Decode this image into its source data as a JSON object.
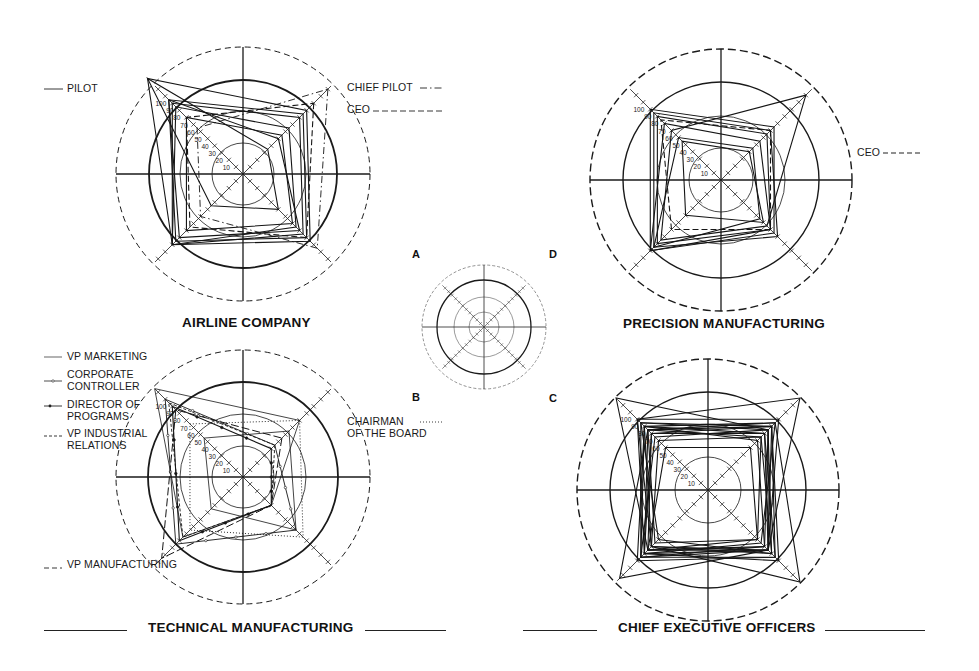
{
  "figure": {
    "key_letters": [
      "A",
      "B",
      "C",
      "D"
    ]
  },
  "charts": [
    {
      "id": "airline",
      "title": "AIRLINE COMPANY",
      "legend": [
        {
          "label": "PILOT",
          "style": "solid"
        },
        {
          "label": "CHIEF PILOT",
          "style": "dash-dot"
        },
        {
          "label": "CEO",
          "style": "dashed"
        }
      ]
    },
    {
      "id": "precision",
      "title": "PRECISION MANUFACTURING",
      "legend": [
        {
          "label": "CEO",
          "style": "dashed"
        }
      ]
    },
    {
      "id": "technical",
      "title": "TECHNICAL MANUFACTURING",
      "legend": [
        {
          "label": "VP MARKETING",
          "style": "solid-thin"
        },
        {
          "label_lines": [
            "CORPORATE",
            "CONTROLLER"
          ],
          "style": "solid-open-marker"
        },
        {
          "label_lines": [
            "DIRECTOR OF",
            "PROGRAMS"
          ],
          "style": "solid-filled-marker"
        },
        {
          "label_lines": [
            "VP INDUSTRIAL",
            "RELATIONS"
          ],
          "style": "short-dash"
        },
        {
          "label_lines": [
            "CHAIRMAN",
            "OF THE BOARD"
          ],
          "style": "dotted"
        },
        {
          "label": "VP MANUFACTURING",
          "style": "long-dash"
        }
      ]
    },
    {
      "id": "ceo",
      "title": "CHIEF EXECUTIVE OFFICERS",
      "legend": []
    }
  ],
  "chart_data": [
    {
      "type": "radar",
      "title": "AIRLINE COMPANY",
      "axes": [
        "NE (A-D diagonal)",
        "SE",
        "SW",
        "NW"
      ],
      "scale_ticks": [
        10,
        20,
        30,
        40,
        50,
        60,
        70,
        80,
        90,
        100
      ],
      "rings": [
        "inner",
        "middle",
        "bold",
        "outer-dashed"
      ],
      "grid": true,
      "center": [
        243,
        174
      ],
      "radii": {
        "inner": 31,
        "middle": 63,
        "bold": 94,
        "outer": 127
      },
      "unit_px": 1.0,
      "series": [
        {
          "name": "PILOT",
          "style": "solid",
          "values": [
            90,
            95,
            100,
            135
          ]
        },
        {
          "name": "PILOT",
          "style": "solid",
          "values": [
            85,
            90,
            95,
            105
          ]
        },
        {
          "name": "PILOT",
          "style": "solid",
          "values": [
            80,
            85,
            100,
            100
          ]
        },
        {
          "name": "PILOT",
          "style": "solid",
          "values": [
            65,
            75,
            100,
            95
          ]
        },
        {
          "name": "PILOT",
          "style": "solid",
          "values": [
            50,
            80,
            90,
            105
          ]
        },
        {
          "name": "PILOT",
          "style": "solid",
          "values": [
            35,
            50,
            45,
            135
          ]
        },
        {
          "name": "PILOT",
          "style": "solid",
          "values": [
            55,
            70,
            80,
            80
          ]
        },
        {
          "name": "CHIEF PILOT",
          "style": "dash-dot",
          "values": [
            120,
            105,
            60,
            65
          ]
        },
        {
          "name": "CEO",
          "style": "dashed",
          "values": [
            100,
            90,
            75,
            80
          ]
        }
      ]
    },
    {
      "type": "radar",
      "title": "PRECISION MANUFACTURING",
      "axes": [
        "NE",
        "SE",
        "SW",
        "NW"
      ],
      "scale_ticks": [
        10,
        20,
        30,
        40,
        50,
        60,
        70,
        80,
        90,
        100
      ],
      "grid": true,
      "center": [
        721,
        180
      ],
      "radii": {
        "inner": 32,
        "middle": 64,
        "bold": 98,
        "outer": 131
      },
      "unit_px": 1.0,
      "series": [
        {
          "name": "manager",
          "style": "solid",
          "values": [
            75,
            75,
            100,
            100
          ]
        },
        {
          "name": "manager",
          "style": "solid",
          "values": [
            70,
            80,
            95,
            95
          ]
        },
        {
          "name": "manager",
          "style": "solid",
          "values": [
            65,
            70,
            90,
            90
          ]
        },
        {
          "name": "manager",
          "style": "solid",
          "values": [
            55,
            70,
            100,
            80
          ]
        },
        {
          "name": "manager",
          "style": "solid",
          "values": [
            120,
            65,
            85,
            70
          ]
        },
        {
          "name": "manager",
          "style": "solid",
          "values": [
            40,
            60,
            50,
            55
          ]
        },
        {
          "name": "manager",
          "style": "solid",
          "values": [
            45,
            55,
            95,
            60
          ]
        },
        {
          "name": "CEO",
          "style": "dashed",
          "values": [
            70,
            70,
            70,
            85
          ]
        }
      ]
    },
    {
      "type": "radar",
      "title": "TECHNICAL MANUFACTURING",
      "axes": [
        "NE",
        "SE",
        "SW",
        "NW"
      ],
      "scale_ticks": [
        10,
        20,
        30,
        40,
        50,
        60,
        70,
        80,
        90,
        100
      ],
      "grid": true,
      "center": [
        243,
        477
      ],
      "radii": {
        "inner": 31,
        "middle": 63,
        "bold": 95,
        "outer": 127
      },
      "unit_px": 1.0,
      "series": [
        {
          "name": "VP MARKETING",
          "style": "solid-thin",
          "values": [
            80,
            40,
            85,
            125
          ]
        },
        {
          "name": "CORPORATE CONTROLLER",
          "style": "solid-open-marker",
          "values": [
            45,
            75,
            95,
            110
          ]
        },
        {
          "name": "DIRECTOR OF PROGRAMS",
          "style": "solid-filled-marker",
          "values": [
            40,
            40,
            90,
            100
          ]
        },
        {
          "name": "VP INDUSTRIAL RELATIONS",
          "style": "short-dash",
          "values": [
            45,
            40,
            85,
            105
          ]
        },
        {
          "name": "CHAIRMAN OF THE BOARD",
          "style": "dotted",
          "values": [
            80,
            85,
            75,
            75
          ]
        },
        {
          "name": "VP MANUFACTURING",
          "style": "long-dash",
          "values": [
            55,
            40,
            115,
            95
          ]
        },
        {
          "name": "other",
          "style": "solid-thin",
          "values": [
            65,
            75,
            45,
            55
          ]
        }
      ]
    },
    {
      "type": "radar",
      "title": "CHIEF EXECUTIVE OFFICERS",
      "axes": [
        "NE",
        "SE",
        "SW",
        "NW"
      ],
      "scale_ticks": [
        10,
        20,
        30,
        40,
        50,
        60,
        70,
        80,
        90,
        100
      ],
      "grid": true,
      "center": [
        708,
        490
      ],
      "radii": {
        "inner": 33,
        "middle": 66,
        "bold": 98,
        "outer": 131
      },
      "unit_px": 1.0,
      "series": [
        {
          "name": "CEO",
          "style": "solid",
          "values": [
            130,
            85,
            90,
            100
          ]
        },
        {
          "name": "CEO",
          "style": "solid",
          "values": [
            95,
            130,
            80,
            90
          ]
        },
        {
          "name": "CEO",
          "style": "solid",
          "values": [
            90,
            85,
            125,
            85
          ]
        },
        {
          "name": "CEO",
          "style": "solid",
          "values": [
            85,
            80,
            85,
            130
          ]
        },
        {
          "name": "CEO",
          "style": "solid",
          "values": [
            90,
            95,
            95,
            95
          ]
        },
        {
          "name": "CEO",
          "style": "solid",
          "values": [
            80,
            85,
            85,
            80
          ]
        },
        {
          "name": "CEO",
          "style": "solid",
          "values": [
            75,
            90,
            80,
            70
          ]
        },
        {
          "name": "CEO",
          "style": "solid",
          "values": [
            95,
            75,
            90,
            85
          ]
        },
        {
          "name": "CEO",
          "style": "solid",
          "values": [
            85,
            90,
            70,
            95
          ]
        },
        {
          "name": "CEO",
          "style": "solid",
          "values": [
            70,
            80,
            95,
            90
          ]
        },
        {
          "name": "CEO",
          "style": "solid",
          "values": [
            60,
            70,
            85,
            60
          ]
        },
        {
          "name": "CEO",
          "style": "solid",
          "values": [
            90,
            100,
            90,
            80
          ]
        },
        {
          "name": "CEO",
          "style": "solid",
          "values": [
            80,
            95,
            100,
            90
          ]
        },
        {
          "name": "CEO",
          "style": "solid",
          "values": [
            100,
            85,
            80,
            100
          ]
        },
        {
          "name": "CEO",
          "style": "solid",
          "values": [
            75,
            70,
            75,
            85
          ]
        },
        {
          "name": "CEO",
          "style": "solid",
          "values": [
            85,
            85,
            95,
            75
          ]
        }
      ]
    },
    {
      "type": "radar",
      "title": "key diagram",
      "labels": [
        "A",
        "B",
        "C",
        "D"
      ],
      "center": [
        484,
        327
      ],
      "radii": {
        "inner": 15,
        "middle": 30,
        "bold": 47,
        "outer": 62
      }
    }
  ]
}
